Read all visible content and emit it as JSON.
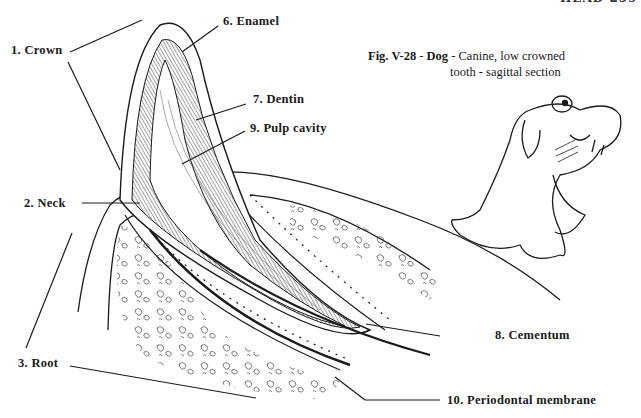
{
  "page_header": "HEAD 259",
  "figure": {
    "number": "Fig. V-28",
    "species": "Dog",
    "caption_rest_line1": "Canine, low crowned",
    "caption_line2": "tooth - sagittal section",
    "sep": " - "
  },
  "labels": [
    {
      "id": "crown",
      "text": "1. Crown"
    },
    {
      "id": "neck",
      "text": "2. Neck"
    },
    {
      "id": "root",
      "text": "3. Root"
    },
    {
      "id": "enamel",
      "text": "6. Enamel"
    },
    {
      "id": "dentin",
      "text": "7. Dentin"
    },
    {
      "id": "cementum",
      "text": "8. Cementum"
    },
    {
      "id": "pulp",
      "text": "9. Pulp cavity"
    },
    {
      "id": "periodontal",
      "text": "10. Periodontal membrane"
    }
  ],
  "colors": {
    "ink": "#1a1a1a",
    "paper": "#ffffff"
  }
}
